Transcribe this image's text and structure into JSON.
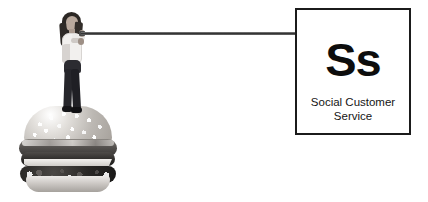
{
  "canvas": {
    "width": 428,
    "height": 202,
    "background_color": "#ffffff"
  },
  "element_card": {
    "symbol": "Ss",
    "name_line_1": "Social Customer",
    "name_line_2": "Service",
    "border_color": "#1b1b1b",
    "symbol_color": "#0d0d0d",
    "text_color": "#151515",
    "background_color": "#ffffff"
  },
  "illustration": {
    "figure_label": "woman-standing-on-burger",
    "burger_label": "hamburger",
    "connector_label": "pointer-rod",
    "connector_color": "#2f2f2f",
    "palette": "grayscale"
  }
}
